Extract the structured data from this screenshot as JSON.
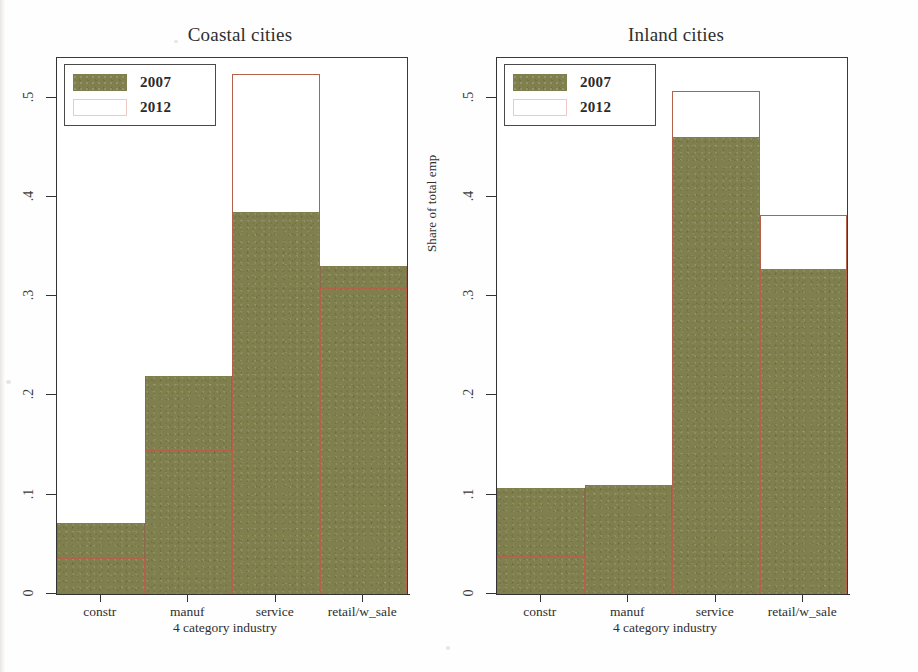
{
  "figure": {
    "yaxis_title": "Share of total emp",
    "xaxis_title": "4 category industry"
  },
  "legend": {
    "series": [
      {
        "label": "2007",
        "key": "filled-olive-swatch",
        "color": "#80804f"
      },
      {
        "label": "2012",
        "key": "outlined-white-swatch",
        "color": "#ffffff",
        "border": "#f0c9c4"
      }
    ]
  },
  "panels": [
    {
      "id": "coastal",
      "title": "Coastal cities"
    },
    {
      "id": "inland",
      "title": "Inland cities"
    }
  ],
  "yticks": [
    {
      "value": 0.5,
      "label": ".5"
    },
    {
      "value": 0.4,
      "label": ".4"
    },
    {
      "value": 0.3,
      "label": ".3"
    },
    {
      "value": 0.2,
      "label": ".2"
    },
    {
      "value": 0.1,
      "label": ".1"
    },
    {
      "value": 0.0,
      "label": "0"
    }
  ],
  "chart_data": [
    {
      "type": "bar",
      "title": "Coastal cities",
      "xlabel": "4 category industry",
      "ylabel": "Share of total emp",
      "ylim": [
        0,
        0.54
      ],
      "grid": false,
      "legend_position": "top-left",
      "bar_style": "overlaid",
      "categories": [
        "constr",
        "service",
        "manuf",
        "retail/w_sale"
      ],
      "tick_labels": [
        "constr",
        "manuf",
        "service",
        "retail/w_sale"
      ],
      "series": [
        {
          "name": "2007",
          "values": [
            0.072,
            0.22,
            0.385,
            0.33
          ]
        },
        {
          "name": "2012",
          "values": [
            0.036,
            0.145,
            0.524,
            0.308
          ]
        }
      ]
    },
    {
      "type": "bar",
      "title": "Inland cities",
      "xlabel": "4 category industry",
      "ylabel": "Share of total emp",
      "ylim": [
        0,
        0.54
      ],
      "grid": false,
      "legend_position": "top-left",
      "bar_style": "overlaid",
      "categories": [
        "constr",
        "service",
        "manuf",
        "retail/w_sale"
      ],
      "tick_labels": [
        "constr",
        "manuf",
        "service",
        "retail/w_sale"
      ],
      "series": [
        {
          "name": "2007",
          "values": [
            0.107,
            0.11,
            0.46,
            0.327
          ]
        },
        {
          "name": "2012",
          "values": [
            0.038,
            0.078,
            0.507,
            0.382
          ]
        }
      ]
    }
  ]
}
